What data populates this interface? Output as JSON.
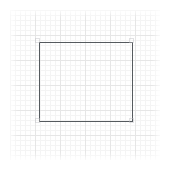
{
  "canvas": {
    "name": "grid-drawing-canvas",
    "width": 175,
    "height": 172,
    "background_color": "#ffffff"
  },
  "grid": {
    "label": "",
    "left": 10,
    "top": 10,
    "width": 150,
    "height": 150,
    "minor_spacing_px": 5,
    "major_spacing_px": 25,
    "minor_color": "#f4f4f4",
    "major_color": "#e6e6e6"
  },
  "shapes": [
    {
      "name": "rectangle",
      "type": "rectangle",
      "x": 39,
      "y": 42,
      "width": 94,
      "height": 80,
      "stroke_color": "#555a5e",
      "stroke_width": 1,
      "fill": "none",
      "label": ""
    }
  ],
  "corner_markers": {
    "label": "",
    "color": "#bebec3",
    "size_px": 5
  }
}
